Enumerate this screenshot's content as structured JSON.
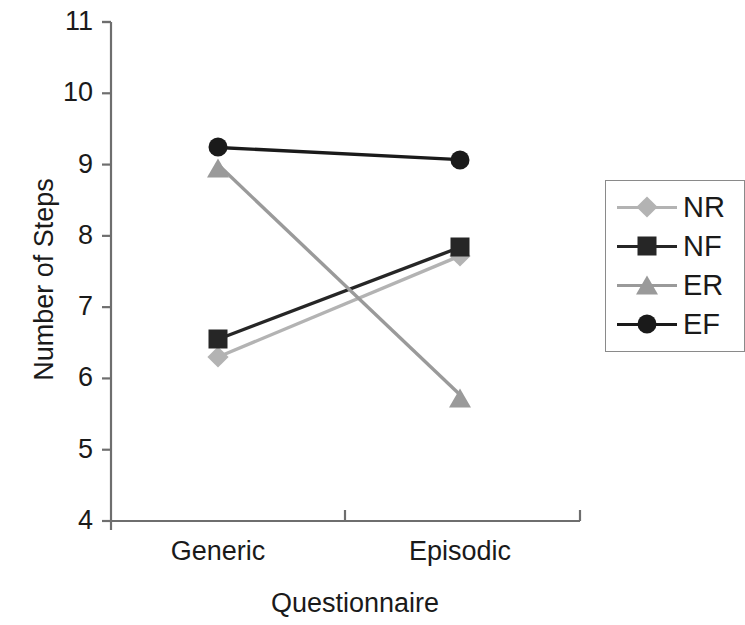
{
  "chart_data": {
    "type": "line",
    "title": "",
    "xlabel": "Questionnaire",
    "ylabel": "Number of Steps",
    "categories": [
      "Generic",
      "Episodic"
    ],
    "ylim": [
      4,
      11
    ],
    "yticks": [
      4,
      5,
      6,
      7,
      8,
      9,
      10,
      11
    ],
    "grid": false,
    "legend_position": "right",
    "series": [
      {
        "name": "NR",
        "values": [
          6.3,
          7.72
        ],
        "color": "#b3b3b3",
        "marker": "diamond"
      },
      {
        "name": "NF",
        "values": [
          6.55,
          7.84
        ],
        "color": "#262626",
        "marker": "square"
      },
      {
        "name": "ER",
        "values": [
          9.0,
          5.77
        ],
        "color": "#9a9a9a",
        "marker": "triangle"
      },
      {
        "name": "EF",
        "values": [
          9.24,
          9.07
        ],
        "color": "#1a1a1a",
        "marker": "circle"
      }
    ]
  },
  "axes": {
    "y_title": "Number of Steps",
    "x_title": "Questionnaire",
    "y_tick_labels": [
      "11",
      "10",
      "9",
      "8",
      "7",
      "6",
      "5",
      "4"
    ],
    "x_tick_labels": [
      "Generic",
      "Episodic"
    ],
    "axis_color": "#6e6e6e"
  },
  "legend": {
    "items": [
      {
        "label": "NR",
        "color": "#b3b3b3",
        "marker": "diamond"
      },
      {
        "label": "NF",
        "color": "#262626",
        "marker": "square"
      },
      {
        "label": "ER",
        "color": "#9a9a9a",
        "marker": "triangle"
      },
      {
        "label": "EF",
        "color": "#1a1a1a",
        "marker": "circle"
      }
    ],
    "border_color": "#8a8a8a"
  }
}
